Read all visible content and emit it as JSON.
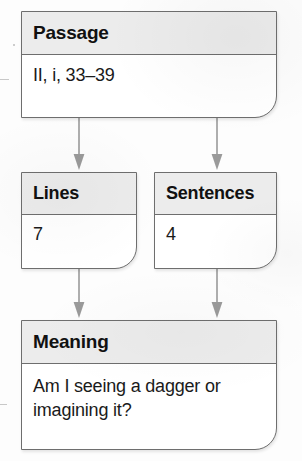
{
  "diagram": {
    "colors": {
      "header_fill": "#ececec",
      "body_fill": "#ffffff",
      "border": "#6e6e6e",
      "arrow": "#9a9a9a",
      "text": "#111111"
    },
    "nodes": [
      {
        "id": "passage",
        "header": "Passage",
        "body": "II, i, 33–39"
      },
      {
        "id": "lines",
        "header": "Lines",
        "body": "7"
      },
      {
        "id": "sentences",
        "header": "Sentences",
        "body": "4"
      },
      {
        "id": "meaning",
        "header": "Meaning",
        "body": "Am I seeing a dagger or imagining it?"
      }
    ],
    "edges": [
      {
        "id": "passage-lines",
        "from": "passage",
        "to": "lines",
        "label": ""
      },
      {
        "id": "passage-sentences",
        "from": "passage",
        "to": "sentences",
        "label": ""
      },
      {
        "id": "lines-meaning",
        "from": "lines",
        "to": "meaning",
        "label": ""
      },
      {
        "id": "sentences-meaning",
        "from": "sentences",
        "to": "meaning",
        "label": ""
      }
    ]
  }
}
